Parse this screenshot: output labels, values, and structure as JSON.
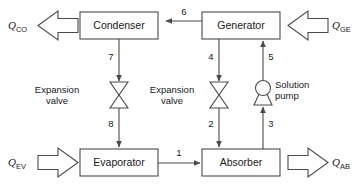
{
  "diagram": {
    "stroke_color": "#4a4a4a",
    "text_color": "#1a1a1a",
    "background_color": "#ffffff"
  },
  "units": [
    {
      "id": "condenser",
      "label": "Condenser"
    },
    {
      "id": "generator",
      "label": "Generator"
    },
    {
      "id": "evaporator",
      "label": "Evaporator"
    },
    {
      "id": "absorber",
      "label": "Absorber"
    }
  ],
  "devices": [
    {
      "id": "expansion-valve-left",
      "line1": "Expansion",
      "line2": "valve"
    },
    {
      "id": "expansion-valve-right",
      "line1": "Expansion",
      "line2": "valve"
    },
    {
      "id": "solution-pump",
      "line1": "Solution",
      "line2": "pump"
    }
  ],
  "heat_flows": [
    {
      "id": "q-co",
      "symbol": "Q",
      "subscript": "CO",
      "direction": "out-left",
      "unit": "condenser"
    },
    {
      "id": "q-ge",
      "symbol": "Q",
      "subscript": "GE",
      "direction": "in-left",
      "unit": "generator"
    },
    {
      "id": "q-ev",
      "symbol": "Q",
      "subscript": "EV",
      "direction": "in-right",
      "unit": "evaporator"
    },
    {
      "id": "q-ab",
      "symbol": "Q",
      "subscript": "AB",
      "direction": "out-right",
      "unit": "absorber"
    }
  ],
  "streams": [
    {
      "id": "stream-1",
      "label": "1",
      "from": "evaporator",
      "to": "absorber"
    },
    {
      "id": "stream-2",
      "label": "2",
      "from": "expansion-valve-right",
      "to": "absorber"
    },
    {
      "id": "stream-3",
      "label": "3",
      "from": "absorber",
      "to": "solution-pump"
    },
    {
      "id": "stream-4",
      "label": "4",
      "from": "generator",
      "to": "expansion-valve-right"
    },
    {
      "id": "stream-5",
      "label": "5",
      "from": "solution-pump",
      "to": "generator"
    },
    {
      "id": "stream-6",
      "label": "6",
      "from": "generator",
      "to": "condenser"
    },
    {
      "id": "stream-7",
      "label": "7",
      "from": "condenser",
      "to": "expansion-valve-left"
    },
    {
      "id": "stream-8",
      "label": "8",
      "from": "expansion-valve-left",
      "to": "evaporator"
    }
  ]
}
